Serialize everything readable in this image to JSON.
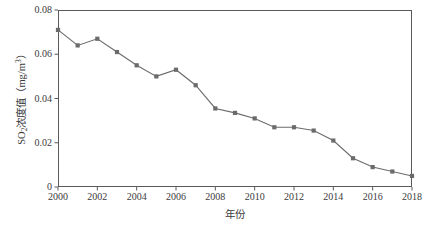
{
  "chart_data": {
    "type": "line",
    "title": "",
    "xlabel": "年份",
    "ylabel_parts": {
      "prefix": "SO",
      "sub": "2",
      "middle": "浓度值（mg/m",
      "sup": "3",
      "suffix": "）"
    },
    "ylabel": "SO2浓度值（mg/m3）",
    "x": [
      2000,
      2001,
      2002,
      2003,
      2004,
      2005,
      2006,
      2007,
      2008,
      2009,
      2010,
      2011,
      2012,
      2013,
      2014,
      2015,
      2016,
      2017,
      2018
    ],
    "values": [
      0.071,
      0.064,
      0.067,
      0.061,
      0.055,
      0.05,
      0.053,
      0.046,
      0.0355,
      0.0335,
      0.031,
      0.027,
      0.027,
      0.0255,
      0.021,
      0.013,
      0.009,
      0.007,
      0.005
    ],
    "xlim": [
      2000,
      2018
    ],
    "ylim": [
      0,
      0.08
    ],
    "xticks": [
      2000,
      2002,
      2004,
      2006,
      2008,
      2010,
      2012,
      2014,
      2016,
      2018
    ],
    "xtick_labels": [
      "2000",
      "2002",
      "2004",
      "2006",
      "2008",
      "2010",
      "2012",
      "2014",
      "2016",
      "2018"
    ],
    "yticks": [
      0,
      0.02,
      0.04,
      0.06,
      0.08
    ],
    "ytick_labels": [
      "0",
      "0.02",
      "0.04",
      "0.06",
      "0.08"
    ],
    "grid": false,
    "legend": false,
    "series_name": "SO2浓度值",
    "line_color": "#6b6b6b",
    "marker_color": "#6b6b6b",
    "marker_shape": "square",
    "frame_color": "#5a5a5a",
    "background": "#ffffff"
  }
}
